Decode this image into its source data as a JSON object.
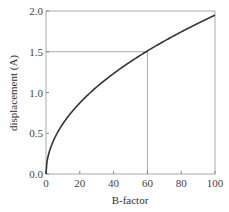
{
  "chart_data": {
    "type": "line",
    "title": "",
    "xlabel": "B-factor",
    "ylabel": "displacement (A)",
    "xlim": [
      0,
      100
    ],
    "ylim": [
      0,
      2.0
    ],
    "xticks": [
      0,
      20,
      40,
      60,
      80,
      100
    ],
    "xtick_labels": [
      "0",
      "20",
      "40",
      "60",
      "80",
      "100"
    ],
    "yticks": [
      0,
      0.5,
      1.0,
      1.5,
      2.0
    ],
    "ytick_labels": [
      "0.0",
      "0.5",
      "1.0",
      "1.5",
      "2.0"
    ],
    "grid": false,
    "legend": "none",
    "series": [
      {
        "name": "displacement",
        "formula": "sqrt(3*B/(8*pi^2))",
        "x": [
          0,
          1,
          2,
          5,
          10,
          15,
          20,
          25,
          30,
          35,
          40,
          45,
          50,
          55,
          60,
          65,
          70,
          75,
          80,
          85,
          90,
          95,
          100
        ],
        "y": [
          0.0,
          0.195,
          0.276,
          0.436,
          0.616,
          0.755,
          0.872,
          0.975,
          1.068,
          1.153,
          1.233,
          1.308,
          1.378,
          1.446,
          1.51,
          1.572,
          1.631,
          1.688,
          1.744,
          1.797,
          1.85,
          1.9,
          1.949
        ],
        "color": "#333333"
      }
    ],
    "annotations": [
      {
        "type": "reference-lines",
        "x": 60,
        "y": 1.5,
        "color": "#aaaaaa"
      }
    ]
  }
}
